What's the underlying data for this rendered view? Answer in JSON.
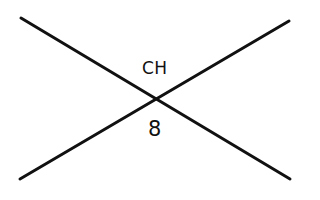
{
  "diagram": {
    "stroke_color": "#111111",
    "stroke_width": 3,
    "lines": [
      {
        "name": "descending-line",
        "x1": 21,
        "y1": 18,
        "x2": 290,
        "y2": 179
      },
      {
        "name": "ascending-line",
        "x1": 20,
        "y1": 179,
        "x2": 289,
        "y2": 21
      }
    ],
    "intersection": {
      "x": 155,
      "y": 98
    },
    "labels": {
      "top": "CH",
      "bottom": "8"
    }
  }
}
